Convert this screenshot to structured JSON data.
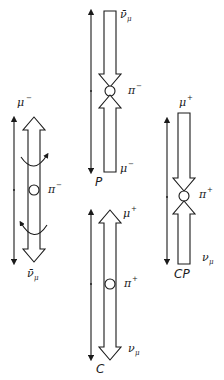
{
  "diagram": {
    "colors": {
      "ink": "#1a1a1a",
      "background": "#ffffff"
    },
    "panels": {
      "original": {
        "parent": {
          "symbol": "π",
          "charge": "−"
        },
        "upper": {
          "symbol": "μ",
          "charge": "−"
        },
        "lower": {
          "symbol": "ν̄",
          "subscript": "μ",
          "bar": true
        },
        "rotation_arrows": 2,
        "caption": ""
      },
      "parity": {
        "caption": "P",
        "parent": {
          "symbol": "π",
          "charge": "−"
        },
        "upper": {
          "symbol": "ν̄",
          "subscript": "μ",
          "bar": true
        },
        "lower": {
          "symbol": "μ",
          "charge": "−"
        }
      },
      "charge_conjugation": {
        "caption": "C",
        "parent": {
          "symbol": "π",
          "charge": "+"
        },
        "upper": {
          "symbol": "μ",
          "charge": "+"
        },
        "lower": {
          "symbol": "ν",
          "subscript": "μ"
        }
      },
      "cp": {
        "caption": "CP",
        "parent": {
          "symbol": "π",
          "charge": "+"
        },
        "upper": {
          "symbol": "μ",
          "charge": "+"
        },
        "lower": {
          "symbol": "ν",
          "subscript": "μ"
        }
      }
    }
  }
}
